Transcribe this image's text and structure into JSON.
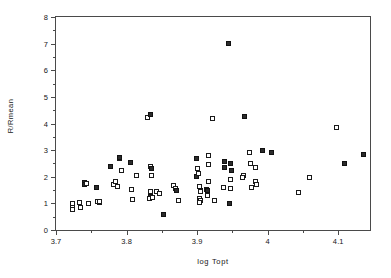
{
  "chart_data": {
    "type": "scatter",
    "title": "",
    "xlabel": "log Topt",
    "ylabel": "R/Rmean",
    "xlim": [
      3.7,
      4.145
    ],
    "ylim": [
      0,
      8
    ],
    "grid": false,
    "legend": null,
    "x_ticks": [
      3.7,
      3.8,
      3.9,
      4,
      4.1
    ],
    "x_tick_labels": [
      "3.7",
      "3.8",
      "3.9",
      "4",
      "4.1"
    ],
    "x_minor_step": 0.05,
    "y_ticks": [
      0,
      1,
      2,
      3,
      4,
      5,
      6,
      7,
      8
    ],
    "y_tick_labels": [
      "0",
      "1",
      "2",
      "3",
      "4",
      "5",
      "6",
      "7",
      "8"
    ],
    "marker": "open-square",
    "marker_color": "#1a1a1a",
    "points": [
      {
        "x": 3.7235,
        "y": 1.0,
        "f": 0
      },
      {
        "x": 3.7235,
        "y": 0.86,
        "f": 0
      },
      {
        "x": 3.724,
        "y": 0.78,
        "f": 0
      },
      {
        "x": 3.733,
        "y": 1.02,
        "f": 0
      },
      {
        "x": 3.7345,
        "y": 0.86,
        "f": 0
      },
      {
        "x": 3.7405,
        "y": 1.79,
        "f": 1
      },
      {
        "x": 3.74,
        "y": 1.71,
        "f": 1
      },
      {
        "x": 3.743,
        "y": 1.74,
        "f": 0
      },
      {
        "x": 3.7455,
        "y": 1.0,
        "f": 0
      },
      {
        "x": 3.758,
        "y": 1.6,
        "f": 1
      },
      {
        "x": 3.7595,
        "y": 1.08,
        "f": 0
      },
      {
        "x": 3.761,
        "y": 1.05,
        "f": 0
      },
      {
        "x": 3.762,
        "y": 1.06,
        "f": 0
      },
      {
        "x": 3.7775,
        "y": 2.4,
        "f": 1
      },
      {
        "x": 3.7815,
        "y": 1.72,
        "f": 0
      },
      {
        "x": 3.785,
        "y": 1.82,
        "f": 0
      },
      {
        "x": 3.7865,
        "y": 1.62,
        "f": 0
      },
      {
        "x": 3.79,
        "y": 2.68,
        "f": 0
      },
      {
        "x": 3.7905,
        "y": 2.72,
        "f": 1
      },
      {
        "x": 3.793,
        "y": 2.22,
        "f": 0
      },
      {
        "x": 3.806,
        "y": 2.55,
        "f": 1
      },
      {
        "x": 3.8075,
        "y": 1.53,
        "f": 0
      },
      {
        "x": 3.809,
        "y": 1.15,
        "f": 0
      },
      {
        "x": 3.8145,
        "y": 2.06,
        "f": 0
      },
      {
        "x": 3.8295,
        "y": 4.24,
        "f": 0
      },
      {
        "x": 3.834,
        "y": 4.34,
        "f": 1
      },
      {
        "x": 3.8345,
        "y": 2.38,
        "f": 0
      },
      {
        "x": 3.835,
        "y": 2.3,
        "f": 1
      },
      {
        "x": 3.8355,
        "y": 2.05,
        "f": 0
      },
      {
        "x": 3.8335,
        "y": 1.44,
        "f": 0
      },
      {
        "x": 3.8345,
        "y": 1.27,
        "f": 1
      },
      {
        "x": 3.833,
        "y": 1.2,
        "f": 0
      },
      {
        "x": 3.837,
        "y": 1.22,
        "f": 0
      },
      {
        "x": 3.842,
        "y": 1.44,
        "f": 0
      },
      {
        "x": 3.847,
        "y": 1.36,
        "f": 0
      },
      {
        "x": 3.852,
        "y": 0.58,
        "f": 1
      },
      {
        "x": 3.867,
        "y": 1.68,
        "f": 0
      },
      {
        "x": 3.869,
        "y": 1.55,
        "f": 0
      },
      {
        "x": 3.8705,
        "y": 1.5,
        "f": 1
      },
      {
        "x": 3.873,
        "y": 1.09,
        "f": 0
      },
      {
        "x": 3.899,
        "y": 2.68,
        "f": 1
      },
      {
        "x": 3.8995,
        "y": 2.0,
        "f": 1
      },
      {
        "x": 3.9,
        "y": 2.31,
        "f": 0
      },
      {
        "x": 3.9025,
        "y": 2.12,
        "f": 0
      },
      {
        "x": 3.9035,
        "y": 1.63,
        "f": 0
      },
      {
        "x": 3.9045,
        "y": 1.48,
        "f": 1
      },
      {
        "x": 3.905,
        "y": 1.43,
        "f": 0
      },
      {
        "x": 3.903,
        "y": 1.18,
        "f": 0
      },
      {
        "x": 3.9045,
        "y": 1.1,
        "f": 0
      },
      {
        "x": 3.9035,
        "y": 1.03,
        "f": 0
      },
      {
        "x": 3.916,
        "y": 2.78,
        "f": 0
      },
      {
        "x": 3.9165,
        "y": 2.46,
        "f": 0
      },
      {
        "x": 3.916,
        "y": 1.83,
        "f": 0
      },
      {
        "x": 3.913,
        "y": 1.52,
        "f": 0
      },
      {
        "x": 3.915,
        "y": 1.5,
        "f": 1
      },
      {
        "x": 3.914,
        "y": 1.3,
        "f": 0
      },
      {
        "x": 3.9215,
        "y": 4.18,
        "f": 0
      },
      {
        "x": 3.925,
        "y": 1.12,
        "f": 0
      },
      {
        "x": 3.9395,
        "y": 2.58,
        "f": 1
      },
      {
        "x": 3.939,
        "y": 2.35,
        "f": 1
      },
      {
        "x": 3.937,
        "y": 1.6,
        "f": 0
      },
      {
        "x": 3.944,
        "y": 7.0,
        "f": 1
      },
      {
        "x": 3.9455,
        "y": 1.0,
        "f": 1
      },
      {
        "x": 3.948,
        "y": 2.5,
        "f": 1
      },
      {
        "x": 3.949,
        "y": 2.22,
        "f": 1
      },
      {
        "x": 3.948,
        "y": 1.88,
        "f": 0
      },
      {
        "x": 3.9475,
        "y": 1.55,
        "f": 0
      },
      {
        "x": 3.9665,
        "y": 4.25,
        "f": 1
      },
      {
        "x": 3.9655,
        "y": 2.05,
        "f": 0
      },
      {
        "x": 3.964,
        "y": 1.96,
        "f": 0
      },
      {
        "x": 3.9745,
        "y": 2.9,
        "f": 0
      },
      {
        "x": 3.9755,
        "y": 2.48,
        "f": 0
      },
      {
        "x": 3.9765,
        "y": 1.6,
        "f": 0
      },
      {
        "x": 3.983,
        "y": 2.35,
        "f": 0
      },
      {
        "x": 3.9825,
        "y": 1.82,
        "f": 0
      },
      {
        "x": 3.984,
        "y": 1.72,
        "f": 0
      },
      {
        "x": 3.992,
        "y": 2.99,
        "f": 1
      },
      {
        "x": 4.005,
        "y": 2.92,
        "f": 1
      },
      {
        "x": 4.043,
        "y": 1.42,
        "f": 0
      },
      {
        "x": 4.059,
        "y": 1.98,
        "f": 0
      },
      {
        "x": 4.0975,
        "y": 3.84,
        "f": 0
      },
      {
        "x": 4.1085,
        "y": 2.48,
        "f": 1
      },
      {
        "x": 4.136,
        "y": 2.85,
        "f": 1
      }
    ]
  }
}
